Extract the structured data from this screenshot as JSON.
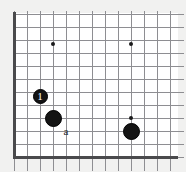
{
  "figure": {
    "kind": "go-board-corner-diagram",
    "width": 186,
    "height": 172,
    "background_color": "#f1f1f0",
    "board_color": "#ffffff",
    "line_color": "#8e8e92",
    "edge_color": "#4a4a4c",
    "stone_black_color": "#141414",
    "stone_label_color": "#ffffff",
    "point_label_color": "#2a2a2a"
  },
  "grid": {
    "spacing": 13,
    "origin_x": 14,
    "origin_y": 14,
    "columns": 13,
    "rows": 12,
    "thick_edges": [
      "left",
      "bottom"
    ]
  },
  "star_points": [
    {
      "name": "star-point-upper-left",
      "col": 3,
      "row": 3,
      "x": 53,
      "y": 44
    },
    {
      "name": "star-point-upper-right",
      "col": 9,
      "row": 3,
      "x": 131,
      "y": 44
    },
    {
      "name": "star-point-lower-right",
      "col": 9,
      "row": 9,
      "x": 131,
      "y": 118
    }
  ],
  "stones": [
    {
      "name": "stone-1",
      "color": "black",
      "label": "1",
      "col": 2,
      "row": 7,
      "x": 40,
      "y": 96,
      "diameter": 15
    },
    {
      "name": "stone-black-left",
      "color": "black",
      "label": "",
      "col": 3,
      "row": 9,
      "x": 53,
      "y": 118,
      "diameter": 17
    },
    {
      "name": "stone-black-right",
      "color": "black",
      "label": "",
      "col": 9,
      "row": 10,
      "x": 131,
      "y": 131,
      "diameter": 17
    }
  ],
  "point_labels": [
    {
      "name": "point-label-a",
      "text": "a",
      "col": 4,
      "row": 10,
      "x": 66,
      "y": 131
    }
  ]
}
